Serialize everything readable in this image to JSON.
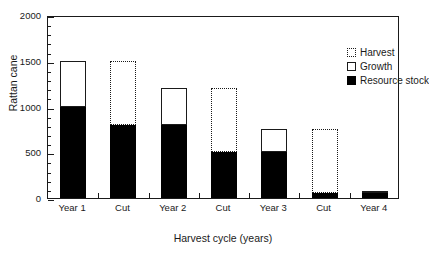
{
  "chart_data": {
    "type": "bar",
    "title": "",
    "subtitle": "",
    "xlabel": "Harvest cycle (years)",
    "ylabel": "Rattan cane",
    "categories": [
      "Year 1",
      "Cut",
      "Year 2",
      "Cut",
      "Year 3",
      "Cut",
      "Year 4"
    ],
    "ylim": [
      0,
      2000
    ],
    "yticks": [
      0,
      500,
      1000,
      1500,
      2000
    ],
    "ytick_labels": [
      "0",
      "500",
      "1000",
      "1500",
      "2000"
    ],
    "yminor_step": 100,
    "grid": false,
    "legend_position": "top-right",
    "stacked": true,
    "series": [
      {
        "name": "Resource stock",
        "style": "filled-black",
        "color": "#000000",
        "values": [
          1000,
          800,
          800,
          500,
          500,
          50,
          50
        ]
      },
      {
        "name": "Growth",
        "style": "open-solid-outline",
        "color": "#ffffff",
        "values": [
          500,
          0,
          400,
          0,
          250,
          0,
          25
        ]
      },
      {
        "name": "Harvest",
        "style": "open-dotted-outline",
        "color": "#ffffff",
        "values": [
          0,
          700,
          0,
          700,
          0,
          700,
          0
        ]
      }
    ],
    "bar_tops": [
      1500,
      1500,
      1200,
      1200,
      750,
      750,
      75
    ]
  },
  "legend": {
    "items": [
      {
        "label": "Harvest",
        "swatch": "dotted-square-icon"
      },
      {
        "label": "Growth",
        "swatch": "open-square-icon"
      },
      {
        "label": "Resource stock",
        "swatch": "filled-square-icon"
      }
    ]
  },
  "axes": {
    "y_title": "Rattan cane",
    "x_title": "Harvest cycle (years)"
  }
}
